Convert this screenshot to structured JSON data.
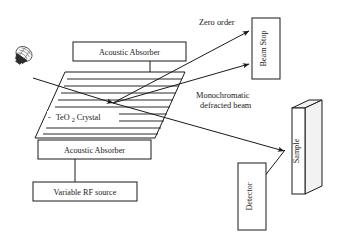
{
  "figure": {
    "background_color": "#ffffff",
    "line_color": "#1a1a1a"
  },
  "components": {
    "light_source": {
      "icon": "light-bulb-icon",
      "label": ""
    },
    "absorber_top": {
      "label": "Acoustic Absorber"
    },
    "absorber_bottom": {
      "label": "Acoustic Absorber"
    },
    "rf_source": {
      "label": "Variable RF source"
    },
    "crystal": {
      "label_prefix": "-",
      "label_main": "TeO",
      "label_sub": "2",
      "label_suffix": " Crystal",
      "full_label": "- TeO2 Crystal",
      "wave_line_count": 9
    },
    "beam_stop": {
      "label": "Beam Stop"
    },
    "sample": {
      "label": "Sample"
    },
    "detector": {
      "label": "Detector"
    }
  },
  "annotations": {
    "zero_order": "Zero order",
    "monochromatic_line1": "Monochromatic",
    "monochromatic_line2": "defracted beam"
  }
}
